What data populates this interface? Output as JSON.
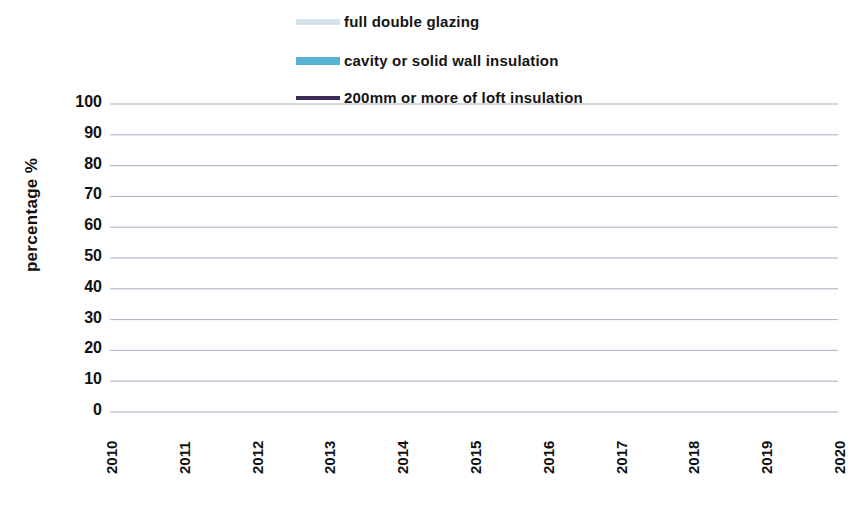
{
  "chart_data": {
    "type": "line",
    "title": "",
    "xlabel": "",
    "ylabel": "percentage %",
    "ylim": [
      0,
      100
    ],
    "ytick_step": 10,
    "grid": true,
    "legend_position": "top-center",
    "categories": [
      "2010",
      "2011",
      "2012",
      "2013",
      "2014",
      "2015",
      "2016",
      "2017",
      "2018",
      "2019",
      "2020"
    ],
    "yticks": [
      "100",
      "90",
      "80",
      "70",
      "60",
      "50",
      "40",
      "30",
      "20",
      "10",
      "0"
    ],
    "series": [
      {
        "name": "full double glazing",
        "color": "#d6e2ea",
        "values": [
          74.0,
          76.5,
          78.5,
          80.0,
          80.8,
          81.3,
          82.5,
          84.0,
          84.6,
          85.2,
          86.2
        ]
      },
      {
        "name": "cavity or solid wall insulation",
        "color": "#58b2d1",
        "values": [
          41.0,
          43.0,
          45.0,
          46.5,
          47.5,
          48.5,
          49.0,
          49.0,
          49.0,
          49.5,
          52.0
        ]
      },
      {
        "name": "200mm or more of loft insulation",
        "color": "#3a2a56",
        "values": [
          26.5,
          30.5,
          34.0,
          36.8,
          38.0,
          37.5,
          36.6,
          37.2,
          37.6,
          38.0,
          38.8
        ]
      }
    ]
  },
  "legend": {
    "items": [
      {
        "label": "full double glazing"
      },
      {
        "label": "cavity or solid wall insulation"
      },
      {
        "label": "200mm or more of loft insulation"
      }
    ]
  },
  "axes": {
    "y_axis_title": "percentage %"
  }
}
